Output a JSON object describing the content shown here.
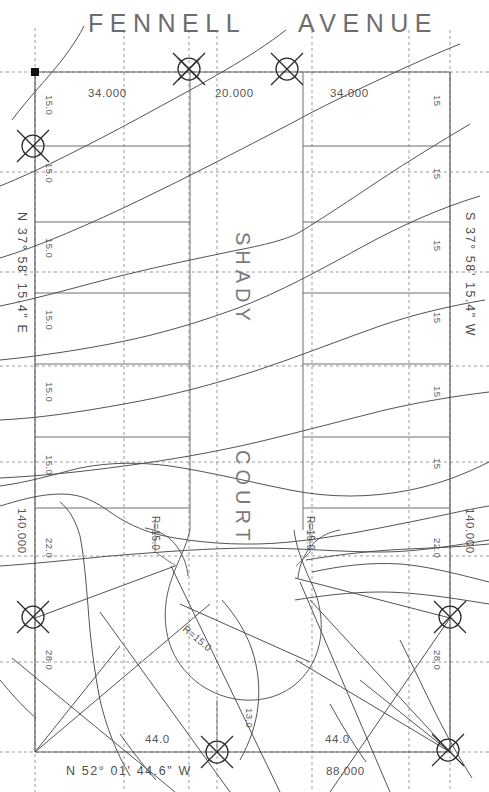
{
  "drawing": {
    "type": "survey-plat",
    "sheet_size": [
      489,
      792
    ],
    "background": "#ffffff",
    "ink_color": "#555555"
  },
  "titles": {
    "street_north_left": "FENNELL",
    "street_north_right": "AVENUE",
    "street_center_upper": "SHADY",
    "street_center_lower": "COURT"
  },
  "bearings": {
    "west_line": "N 37° 58' 15.4\" E",
    "east_line": "S 37° 58' 15.4\" W",
    "south_line": "N 52° 01' 44.6\" W"
  },
  "dimensions": {
    "north_left": "34.000",
    "north_center": "20.000",
    "north_right": "34.000",
    "south_left": "44.0",
    "south_right": "44.0",
    "south_overall": "88.000",
    "west_overall": "140.000",
    "east_overall": "140.000",
    "center_stub": "13.0",
    "west_ticks": [
      "15.0",
      "15.0",
      "15.0",
      "15.0",
      "15.0",
      "15.0",
      "22.0",
      "28.0"
    ],
    "east_ticks": [
      "15",
      "15",
      "15",
      "15",
      "15",
      "15",
      "22.0",
      "28.0"
    ]
  },
  "radii": {
    "left_return": "R=15.0",
    "right_return": "R=15.0",
    "cul_de_sac": "R=15.0"
  },
  "monuments": [
    {
      "name": "monument-north-1",
      "x": 189,
      "y": 69,
      "symbol": "circle-x"
    },
    {
      "name": "monument-north-2",
      "x": 287,
      "y": 69,
      "symbol": "circle-x"
    },
    {
      "name": "monument-west-upper",
      "x": 33,
      "y": 146,
      "symbol": "circle-x"
    },
    {
      "name": "monument-west-lower",
      "x": 33,
      "y": 617,
      "symbol": "circle-x"
    },
    {
      "name": "monument-east-lower",
      "x": 450,
      "y": 617,
      "symbol": "circle-x"
    },
    {
      "name": "monument-south-center",
      "x": 217,
      "y": 752,
      "symbol": "circle-x"
    },
    {
      "name": "monument-south-east",
      "x": 448,
      "y": 750,
      "symbol": "circle-x"
    }
  ],
  "control_point": {
    "name": "corner-point",
    "x": 35,
    "y": 72,
    "symbol": "filled-square"
  }
}
